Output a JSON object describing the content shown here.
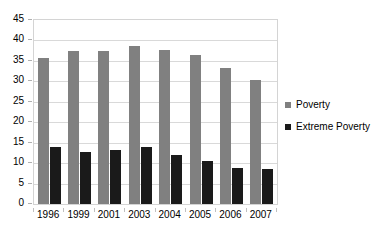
{
  "chart_data": {
    "type": "bar",
    "title": "",
    "xlabel": "",
    "ylabel": "",
    "categories": [
      "1996",
      "1999",
      "2001",
      "2003",
      "2004",
      "2005",
      "2006",
      "2007"
    ],
    "series": [
      {
        "name": "Poverty",
        "color": "#808080",
        "values": [
          35.7,
          37.4,
          37.4,
          38.7,
          37.6,
          36.5,
          33.2,
          30.4
        ]
      },
      {
        "name": "Extreme Poverty",
        "color": "#1a1a1a",
        "values": [
          13.9,
          12.8,
          13.2,
          13.9,
          12.1,
          10.5,
          8.9,
          8.5
        ]
      }
    ],
    "ylim": [
      0,
      45
    ],
    "ytick_step": 5,
    "yticks": [
      "0",
      "5",
      "10",
      "15",
      "20",
      "25",
      "30",
      "35",
      "40",
      "45"
    ],
    "grid": "horizontal",
    "legend_position": "right"
  },
  "legend": {
    "items": [
      {
        "label": "Poverty"
      },
      {
        "label": "Extreme Poverty"
      }
    ]
  }
}
